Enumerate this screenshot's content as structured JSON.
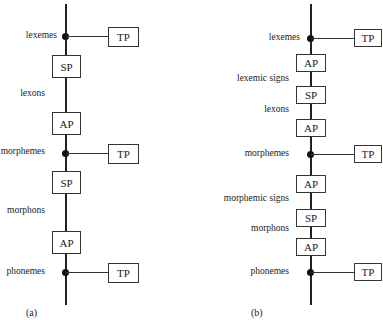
{
  "diagram_a": {
    "caption": "(a)",
    "levels": [
      "lexemes",
      "lexons",
      "morphemes",
      "morphons",
      "phonemes"
    ],
    "tp_boxes": [
      "TP",
      "TP",
      "TP"
    ],
    "process_boxes": [
      "SP",
      "AP",
      "SP",
      "AP"
    ]
  },
  "diagram_b": {
    "caption": "(b)",
    "levels": [
      "lexemes",
      "lexemic signs",
      "lexons",
      "morphemes",
      "morphemic signs",
      "morphons",
      "phonemes"
    ],
    "tp_boxes": [
      "TP",
      "TP",
      "TP"
    ],
    "process_boxes": [
      "AP",
      "SP",
      "AP",
      "AP",
      "SP",
      "AP"
    ]
  }
}
